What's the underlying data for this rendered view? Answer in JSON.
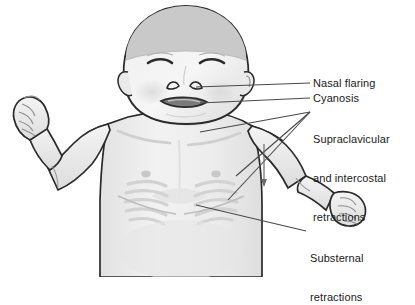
{
  "illustration": {
    "title": "Infant in respiratory distress",
    "subject": "infant",
    "view": "anterior torso and head, arms extended",
    "style": "grayscale line drawing with shading",
    "background_color": "#ffffff",
    "skin_fill": "#f0f0f0",
    "skin_shadow": "#dcdcdc",
    "hair_fill": "#c9c9c9",
    "outline_color": "#2b2b2b",
    "leader_line_color": "#4a4a4a",
    "mouth_color": "#6e6e6e",
    "text_color": "#1a1a1a"
  },
  "labels": {
    "nasal_flaring": "Nasal flaring",
    "cyanosis": "Cyanosis",
    "supraclavicular_line1": "Supraclavicular",
    "supraclavicular_line2": "and intercostal",
    "supraclavicular_line3": "retractions",
    "substernal_line1": "Substernal",
    "substernal_line2": "retractions"
  },
  "anatomy_features": {
    "eyes": "closed, squeezed shut",
    "nostrils": "flared",
    "mouth": "open, darkened indicating cyanosis",
    "chest": "visible intercostal rib retractions both sides",
    "neck": "supraclavicular retraction above clavicle",
    "sternum": "substernal retraction below xiphoid",
    "hands": "both clenched into fists"
  }
}
